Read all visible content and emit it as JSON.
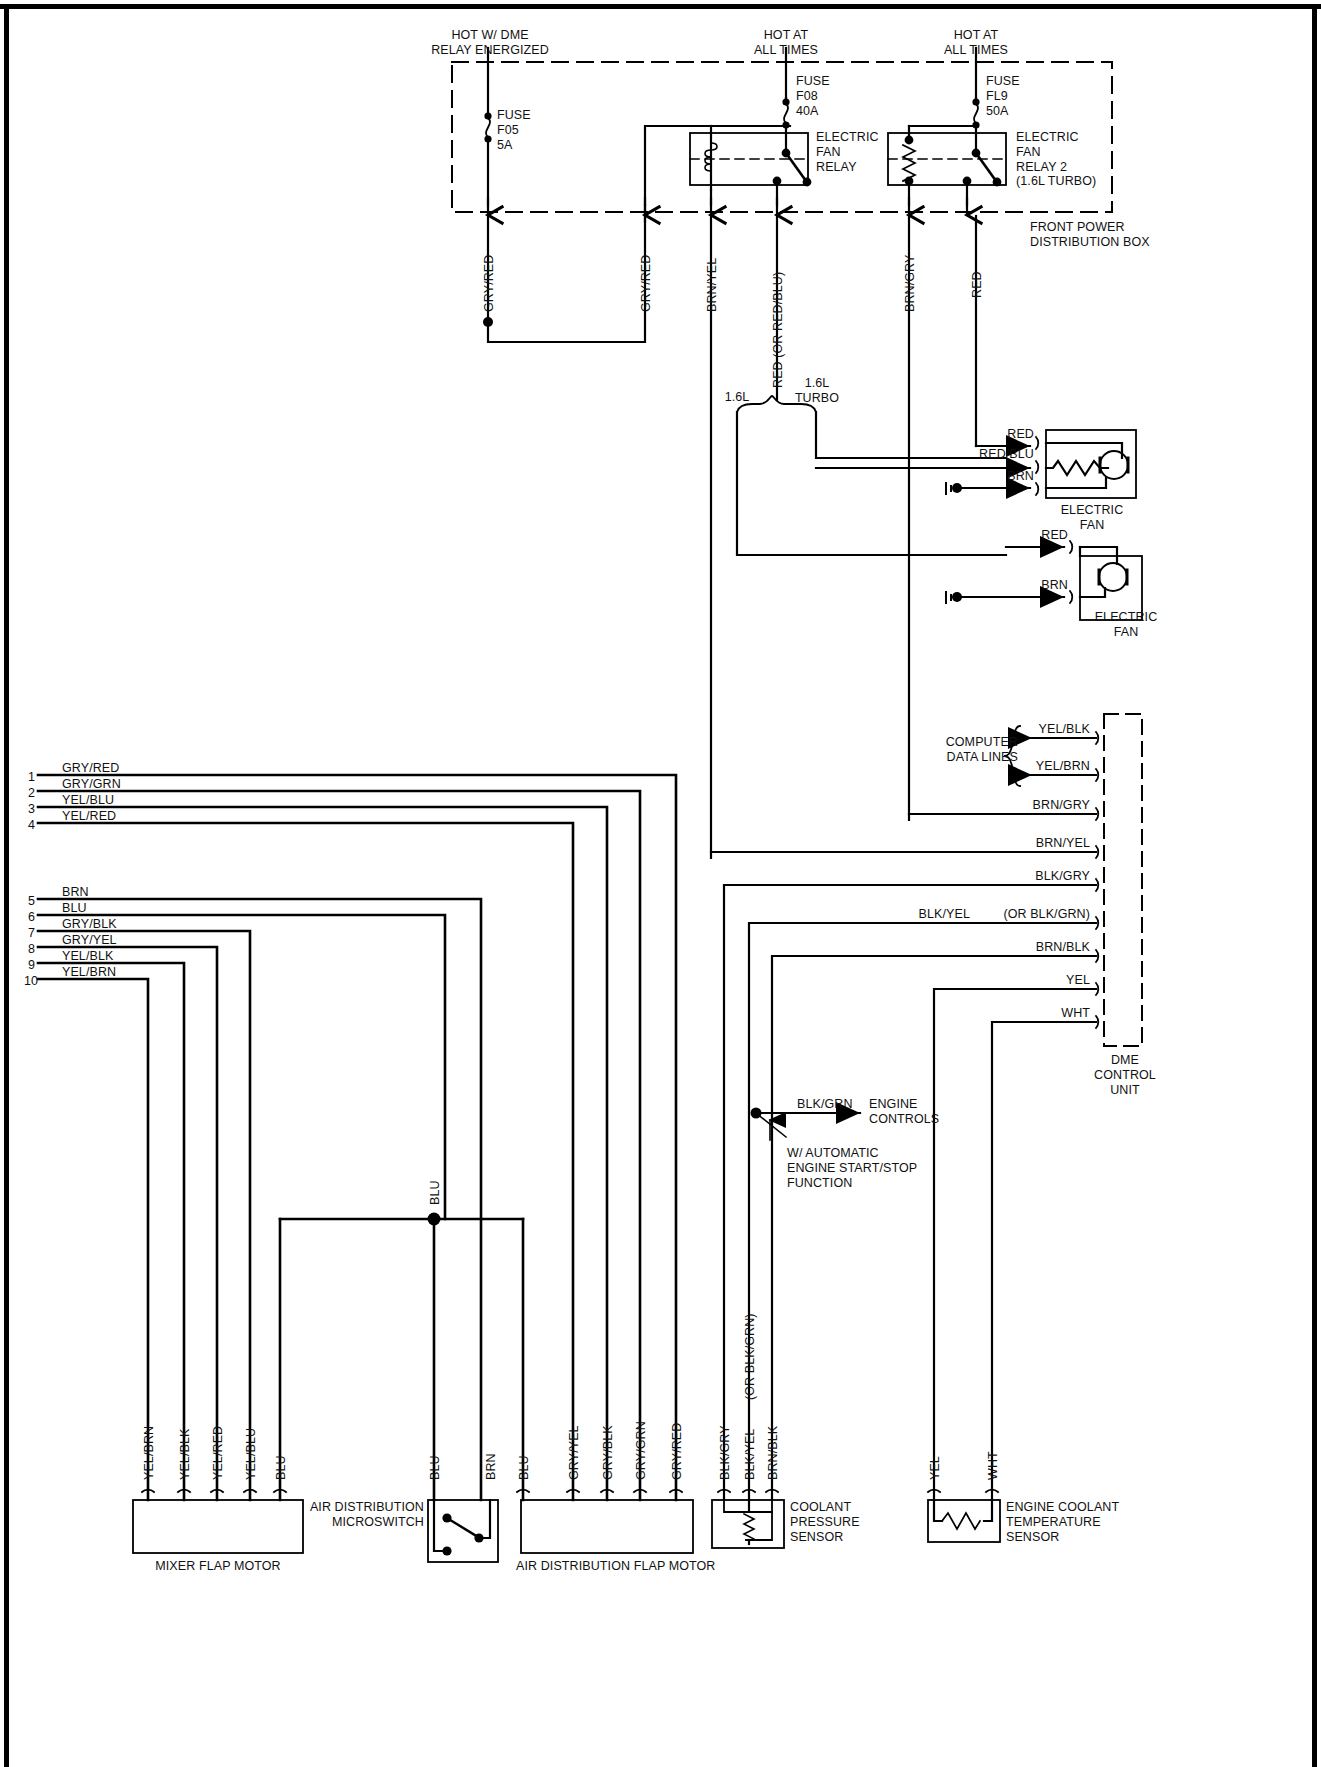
{
  "diagram": {
    "borders": {
      "top": true,
      "left": true,
      "right": true
    }
  },
  "power_sources": [
    {
      "id": "src-dme",
      "line1": "HOT W/ DME",
      "line2": "RELAY ENERGIZED"
    },
    {
      "id": "src-all-1",
      "line1": "HOT AT",
      "line2": "ALL TIMES"
    },
    {
      "id": "src-all-2",
      "line1": "HOT AT",
      "line2": "ALL TIMES"
    }
  ],
  "fuses": [
    {
      "id": "fuse-f05",
      "name": "FUSE",
      "ref": "F05",
      "rating": "5A"
    },
    {
      "id": "fuse-f08",
      "name": "FUSE",
      "ref": "F08",
      "rating": "40A"
    },
    {
      "id": "fuse-fl9",
      "name": "FUSE",
      "ref": "FL9",
      "rating": "50A"
    }
  ],
  "relays": [
    {
      "id": "relay-1",
      "lines": [
        "ELECTRIC",
        "FAN",
        "RELAY"
      ]
    },
    {
      "id": "relay-2",
      "lines": [
        "ELECTRIC",
        "FAN",
        "RELAY 2",
        "(1.6L TURBO)"
      ]
    }
  ],
  "boxes": {
    "front_power_distribution": {
      "line1": "FRONT POWER",
      "line2": "DISTRIBUTION BOX"
    },
    "dme_control_unit": {
      "line1": "DME",
      "line2": "CONTROL",
      "line3": "UNIT"
    }
  },
  "top_wire_labels": [
    {
      "id": "w-gryred-1",
      "text": "GRY/RED"
    },
    {
      "id": "w-gryred-2",
      "text": "GRY/RED"
    },
    {
      "id": "w-brnyel",
      "text": "BRN/YEL"
    },
    {
      "id": "w-red-orredblu",
      "text": "RED  (OR RED/BLU)"
    },
    {
      "id": "w-brngry",
      "text": "BRN/GRY"
    },
    {
      "id": "w-red",
      "text": "RED"
    }
  ],
  "branch_options": [
    {
      "id": "opt-16l",
      "text": "1.6L"
    },
    {
      "id": "opt-16l-turbo-1",
      "text": "1.6L"
    },
    {
      "id": "opt-16l-turbo-2",
      "text": "TURBO"
    }
  ],
  "fans": [
    {
      "id": "electric-fan-1",
      "caption_line1": "ELECTRIC",
      "caption_line2": "FAN",
      "terminals": [
        "RED",
        "RED/BLU",
        "BRN"
      ],
      "motor_glyph": "M",
      "has_resistor": true,
      "has_ground": true
    },
    {
      "id": "electric-fan-2",
      "caption_line1": "ELECTRIC",
      "caption_line2": "FAN",
      "terminals": [
        "RED",
        "BRN"
      ],
      "motor_glyph": "M",
      "has_resistor": false,
      "has_ground": true
    }
  ],
  "computer_data_lines": {
    "label_line1": "COMPUTER",
    "label_line2": "DATA LINES",
    "wires": [
      "YEL/BLK",
      "YEL/BRN"
    ]
  },
  "dme_wires": [
    {
      "id": "dme-yelblk",
      "text": "YEL/BLK",
      "arrow": true
    },
    {
      "id": "dme-yelbrn",
      "text": "YEL/BRN",
      "arrow": true
    },
    {
      "id": "dme-brngry",
      "text": "BRN/GRY",
      "arrow": false
    },
    {
      "id": "dme-brnyel",
      "text": "BRN/YEL",
      "arrow": false
    },
    {
      "id": "dme-blkgry",
      "text": "BLK/GRY",
      "arrow": false
    },
    {
      "id": "dme-blkyel",
      "text": "BLK/YEL",
      "alt": "(OR BLK/GRN)",
      "arrow": false
    },
    {
      "id": "dme-brnblk",
      "text": "BRN/BLK",
      "arrow": false
    },
    {
      "id": "dme-yel",
      "text": "YEL",
      "arrow": false
    },
    {
      "id": "dme-wht",
      "text": "WHT",
      "arrow": false
    }
  ],
  "engine_controls": {
    "wire": "BLK/GRN",
    "label_line1": "ENGINE",
    "label_line2": "CONTROLS",
    "note_line1": "W/ AUTOMATIC",
    "note_line2": "ENGINE START/STOP",
    "note_line3": "FUNCTION"
  },
  "pin_list": [
    {
      "num": "1",
      "color": "GRY/RED"
    },
    {
      "num": "2",
      "color": "GRY/GRN"
    },
    {
      "num": "3",
      "color": "YEL/BLU"
    },
    {
      "num": "4",
      "color": "YEL/RED"
    },
    {
      "num": "5",
      "color": "BRN"
    },
    {
      "num": "6",
      "color": "BLU"
    },
    {
      "num": "7",
      "color": "GRY/BLK"
    },
    {
      "num": "8",
      "color": "GRY/YEL"
    },
    {
      "num": "9",
      "color": "YEL/BLK"
    },
    {
      "num": "10",
      "color": "YEL/BRN"
    }
  ],
  "mid_labels": [
    {
      "id": "blu-junction-label",
      "text": "BLU"
    }
  ],
  "components": [
    {
      "id": "mixer-flap-motor",
      "caption": "MIXER FLAP MOTOR",
      "terminals": [
        "YEL/BRN",
        "YEL/BLK",
        "YEL/RED",
        "YEL/BLU",
        "BLU"
      ]
    },
    {
      "id": "air-distribution-microswitch",
      "caption_line1": "AIR DISTRIBUTION",
      "caption_line2": "MICROSWITCH",
      "terminals": [
        "BLU",
        "BRN"
      ]
    },
    {
      "id": "air-distribution-flap-motor",
      "caption": "AIR DISTRIBUTION FLAP MOTOR",
      "terminals": [
        "BLU",
        "GRY/YEL",
        "GRY/BLK",
        "GRY/GRN",
        "GRY/RED"
      ]
    },
    {
      "id": "coolant-pressure-sensor",
      "caption_line1": "COOLANT",
      "caption_line2": "PRESSURE",
      "caption_line3": "SENSOR",
      "terminals": [
        "BLK/GRY",
        "BLK/YEL",
        "BRN/BLK"
      ],
      "terminal_alt": "(OR BLK/GRN)"
    },
    {
      "id": "engine-coolant-temperature-sensor",
      "caption_line1": "ENGINE COOLANT",
      "caption_line2": "TEMPERATURE",
      "caption_line3": "SENSOR",
      "terminals": [
        "YEL",
        "WHT"
      ]
    }
  ]
}
